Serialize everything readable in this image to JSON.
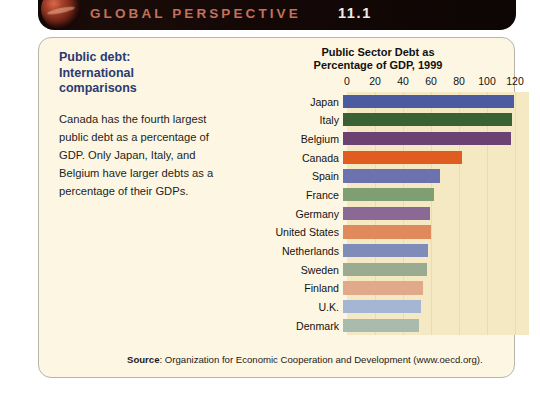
{
  "banner": {
    "title": "GLOBAL PERSPECTIVE",
    "number": "11.1",
    "globe_icon": "globe-icon"
  },
  "sidebar": {
    "title": "Public debt:\nInternational\ncomparisons",
    "body": "Canada has the fourth largest public debt as a percentage of GDP. Only Japan, Italy, and Belgium have larger debts as a percentage of their GDPs."
  },
  "source": {
    "label": "Source",
    "text": ": Organization for Economic Cooperation and Development (www.oecd.org)."
  },
  "chart_data": {
    "type": "bar",
    "orientation": "horizontal",
    "title": "Public Sector Debt as\nPercentage of GDP, 1999",
    "xlabel": "",
    "ylabel": "",
    "xlim": [
      0,
      130
    ],
    "ticks": [
      0,
      20,
      40,
      60,
      80,
      100,
      120
    ],
    "grid": true,
    "legend": "none",
    "categories": [
      "Japan",
      "Italy",
      "Belgium",
      "Canada",
      "Spain",
      "France",
      "Germany",
      "United States",
      "Netherlands",
      "Sweden",
      "Finland",
      "U.K.",
      "Denmark"
    ],
    "values": [
      122,
      121,
      120,
      85,
      69,
      65,
      62,
      63,
      61,
      60,
      57,
      56,
      54
    ],
    "colors": [
      "#4a5ba0",
      "#3a6134",
      "#6b4271",
      "#e05c20",
      "#6b72ae",
      "#7f9e72",
      "#8a6a94",
      "#e08a5c",
      "#7f8cba",
      "#9aab92",
      "#e0a98a",
      "#a5b5d4",
      "#a9bbac"
    ]
  }
}
